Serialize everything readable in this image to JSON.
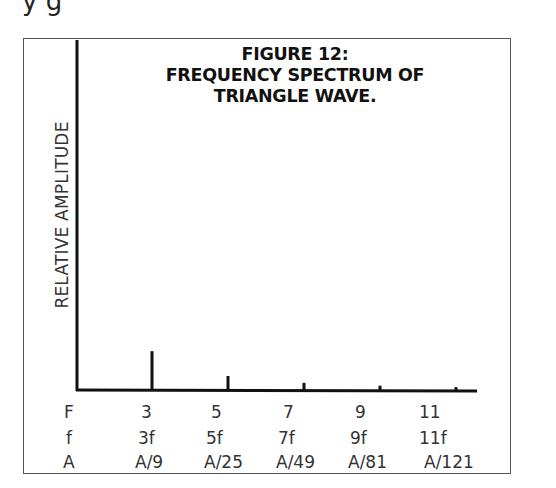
{
  "page": {
    "cut_off_text": "y                    g"
  },
  "figure": {
    "title_lines": [
      "FIGURE 12:",
      "FREQUENCY SPECTRUM OF",
      "TRIANGLE WAVE."
    ],
    "y_axis_label": "RELATIVE AMPLITUDE"
  },
  "table": {
    "rows": [
      {
        "header": "F",
        "values": [
          "3",
          "5",
          "7",
          "9",
          "11"
        ]
      },
      {
        "header": "f",
        "values": [
          "3f",
          "5f",
          "7f",
          "9f",
          "11f"
        ]
      },
      {
        "header": "A",
        "values": [
          "A/9",
          "A/25",
          "A/49",
          "A/81",
          "A/121"
        ]
      }
    ]
  },
  "chart_data": {
    "type": "bar",
    "title": "FIGURE 12: FREQUENCY SPECTRUM OF TRIANGLE WAVE.",
    "xlabel": "F (harmonic number)",
    "ylabel": "RELATIVE AMPLITUDE",
    "categories": [
      "3",
      "5",
      "7",
      "9",
      "11"
    ],
    "harmonic_frequencies": [
      "3f",
      "5f",
      "7f",
      "9f",
      "11f"
    ],
    "amplitude_labels": [
      "A/9",
      "A/25",
      "A/49",
      "A/81",
      "A/121"
    ],
    "values": [
      0.111,
      0.04,
      0.0204,
      0.0123,
      0.0083
    ],
    "ylim": [
      0,
      1
    ],
    "grid": false,
    "legend": null
  }
}
